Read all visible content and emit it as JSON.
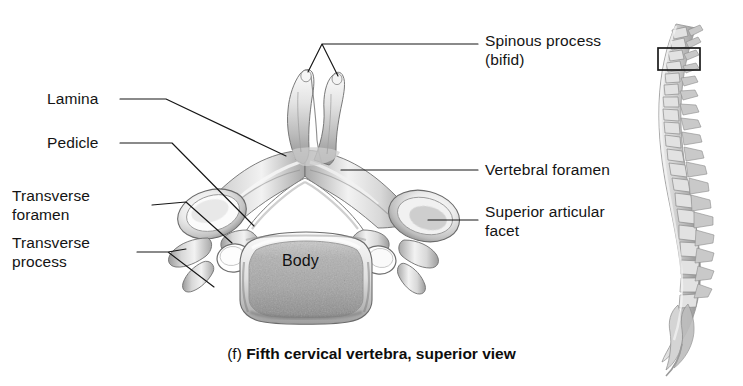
{
  "figure": {
    "caption_letter": "(f)",
    "caption_text": "Fifth cervical vertebra, superior view",
    "background_color": "#ffffff",
    "ink_color": "#161616"
  },
  "labels": {
    "spinous_process": "Spinous process\n(bifid)",
    "lamina": "Lamina",
    "pedicle": "Pedicle",
    "transverse_foramen": "Transverse\nforamen",
    "transverse_process": "Transverse\nprocess",
    "vertebral_foramen": "Vertebral foramen",
    "superior_articular_facet": "Superior articular\nfacet",
    "body": "Body"
  },
  "anatomy_parts": [
    {
      "name": "Spinous process (bifid)",
      "side": "posterior",
      "leader_branches": 2
    },
    {
      "name": "Lamina",
      "side": "left-posterior",
      "leader_branches": 1
    },
    {
      "name": "Pedicle",
      "side": "left",
      "leader_branches": 1
    },
    {
      "name": "Transverse foramen",
      "side": "left",
      "leader_branches": 1
    },
    {
      "name": "Transverse process",
      "side": "left-lateral",
      "leader_branches": 2
    },
    {
      "name": "Vertebral foramen",
      "side": "center",
      "leader_branches": 1
    },
    {
      "name": "Superior articular facet",
      "side": "right-lateral",
      "leader_branches": 1
    },
    {
      "name": "Body",
      "side": "anterior",
      "leader_branches": 0
    }
  ],
  "inset": {
    "description": "Lateral view of vertebral column",
    "highlight_box": {
      "x": 658,
      "y": 48,
      "width": 42,
      "height": 22
    }
  }
}
